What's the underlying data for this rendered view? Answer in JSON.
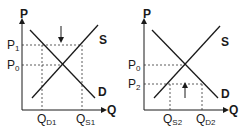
{
  "diagram": {
    "title": "",
    "panels": [
      {
        "name": "price-ceiling-above-equilibrium",
        "y_axis_label": "P",
        "x_axis_label": "Q",
        "supply_label": "S",
        "demand_label": "D",
        "price_labels": [
          {
            "main": "P",
            "sub": "1"
          },
          {
            "main": "P",
            "sub": "0"
          }
        ],
        "quantity_labels": [
          {
            "main": "Q",
            "sub": "D1"
          },
          {
            "main": "Q",
            "sub": "S1"
          }
        ],
        "arrow_direction": "down"
      },
      {
        "name": "price-floor-below-equilibrium",
        "y_axis_label": "P",
        "x_axis_label": "Q",
        "supply_label": "S",
        "demand_label": "D",
        "price_labels": [
          {
            "main": "P",
            "sub": "0"
          },
          {
            "main": "P",
            "sub": "2"
          }
        ],
        "quantity_labels": [
          {
            "main": "Q",
            "sub": "S2"
          },
          {
            "main": "Q",
            "sub": "D2"
          }
        ],
        "arrow_direction": "up"
      }
    ]
  },
  "colors": {
    "line": "#1a1a1a",
    "dashed": "#333333",
    "background": "#ffffff"
  }
}
